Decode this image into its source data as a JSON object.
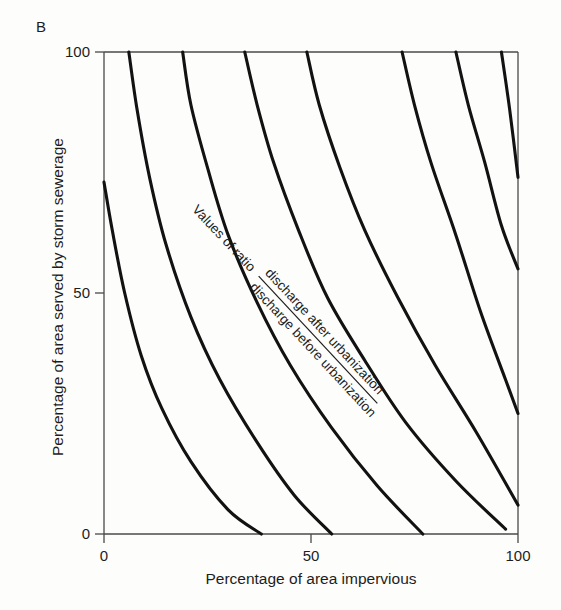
{
  "figure": {
    "panel_label": "B",
    "background_color": "#fdfdfb",
    "curve_color": "#121212",
    "axis_color": "#4a4a4a"
  },
  "annotation": {
    "lead_text": "Values of ratio",
    "numerator": "discharge after urbanization",
    "denominator": "discharge before urbanization"
  },
  "axes": {
    "x": {
      "label": "Percentage of area impervious",
      "ticks": [
        "0",
        "50",
        "100"
      ],
      "min": 0,
      "max": 100
    },
    "y": {
      "label": "Percentage of area served by storm sewerage",
      "ticks": [
        "0",
        "50",
        "100"
      ],
      "min": 0,
      "max": 100
    }
  },
  "chart_data": {
    "type": "line",
    "title": "",
    "subtitle": "",
    "xlabel": "Percentage of area impervious",
    "ylabel": "Percentage of area served by storm sewerage",
    "xlim": [
      0,
      100
    ],
    "ylim": [
      0,
      100
    ],
    "grid": false,
    "legend": "none",
    "annotation": "Values of ratio  discharge after urbanization / discharge before urbanization",
    "note": "Contour nomograph: each curve is an iso-line of the ratio of peak discharge after urbanization to peak discharge before urbanization. Curves run from the top axis (y=100) or left axis down to the bottom axis (y=0) or right axis (x=100).",
    "series": [
      {
        "name": "curve-1",
        "ratio": 1.5,
        "x": [
          0,
          2,
          5,
          9,
          14,
          21,
          30,
          38
        ],
        "y": [
          73,
          63,
          50,
          37,
          26,
          15,
          5,
          0
        ]
      },
      {
        "name": "curve-2",
        "ratio": 2.0,
        "x": [
          6,
          8,
          11,
          15,
          21,
          28,
          37,
          46,
          55
        ],
        "y": [
          100,
          88,
          74,
          60,
          45,
          32,
          19,
          8,
          0
        ]
      },
      {
        "name": "curve-3",
        "ratio": 2.5,
        "x": [
          19,
          21,
          25,
          30,
          37,
          45,
          55,
          66,
          77
        ],
        "y": [
          100,
          89,
          76,
          62,
          48,
          35,
          22,
          10,
          0
        ]
      },
      {
        "name": "curve-4",
        "ratio": 3.0,
        "x": [
          34,
          37,
          41,
          47,
          54,
          63,
          73,
          85,
          97
        ],
        "y": [
          100,
          89,
          77,
          63,
          49,
          36,
          23,
          11,
          1
        ]
      },
      {
        "name": "curve-5",
        "ratio": 3.5,
        "x": [
          49,
          52,
          57,
          63,
          71,
          80,
          90,
          100
        ],
        "y": [
          100,
          89,
          76,
          63,
          49,
          35,
          21,
          6
        ]
      },
      {
        "name": "curve-6",
        "ratio": 4.0,
        "x": [
          72,
          75,
          79,
          85,
          91,
          97,
          100
        ],
        "y": [
          100,
          89,
          77,
          62,
          46,
          32,
          25
        ]
      },
      {
        "name": "curve-7",
        "ratio": 4.5,
        "x": [
          85,
          88,
          92,
          96,
          100
        ],
        "y": [
          100,
          89,
          77,
          64,
          55
        ]
      },
      {
        "name": "curve-8",
        "ratio": 5.0,
        "x": [
          96,
          98,
          100
        ],
        "y": [
          100,
          88,
          74
        ]
      }
    ]
  }
}
